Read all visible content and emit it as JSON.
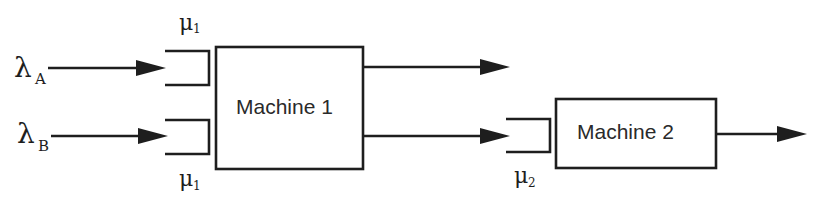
{
  "diagram": {
    "machines": [
      {
        "id": "machine1",
        "label": "Machine 1"
      },
      {
        "id": "machine2",
        "label": "Machine 2"
      }
    ],
    "arrivals": [
      {
        "symbol": "λ",
        "subscript": "A"
      },
      {
        "symbol": "λ",
        "subscript": "B"
      }
    ],
    "service_rates": [
      {
        "symbol": "μ",
        "subscript": "1",
        "position": "top-queue-machine1"
      },
      {
        "symbol": "μ",
        "subscript": "1",
        "position": "bottom-queue-machine1"
      },
      {
        "symbol": "μ",
        "subscript": "2",
        "position": "queue-machine2"
      }
    ],
    "colors": {
      "stroke": "#1e1e1e",
      "background": "#ffffff"
    }
  }
}
